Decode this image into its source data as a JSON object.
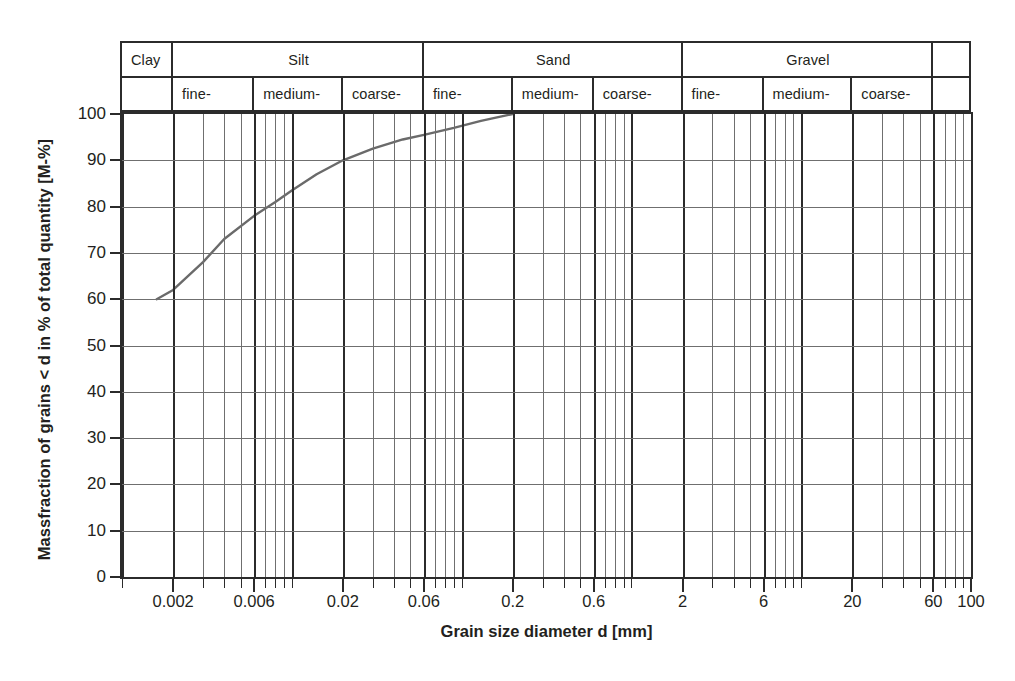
{
  "chart_data": {
    "type": "line",
    "title": "",
    "xlabel": "Grain size diameter d [mm]",
    "ylabel": "Massfraction of grains < d in % of total quantity [M-%]",
    "xscale": "log",
    "xlim": [
      0.001,
      100
    ],
    "ylim": [
      0,
      100
    ],
    "grid": true,
    "legend": "none",
    "x_ticks": [
      {
        "value": 0.002,
        "label": "0.002",
        "major": true
      },
      {
        "value": 0.006,
        "label": "0.006",
        "major": true
      },
      {
        "value": 0.02,
        "label": "0.02",
        "major": true
      },
      {
        "value": 0.06,
        "label": "0.06",
        "major": true
      },
      {
        "value": 0.2,
        "label": "0.2",
        "major": true
      },
      {
        "value": 0.6,
        "label": "0.6",
        "major": true
      },
      {
        "value": 2,
        "label": "2",
        "major": true
      },
      {
        "value": 6,
        "label": "6",
        "major": true
      },
      {
        "value": 20,
        "label": "20",
        "major": true
      },
      {
        "value": 60,
        "label": "60",
        "major": true
      },
      {
        "value": 100,
        "label": "100",
        "major": true
      }
    ],
    "y_ticks": [
      {
        "value": 0,
        "label": "0"
      },
      {
        "value": 10,
        "label": "10"
      },
      {
        "value": 20,
        "label": "20"
      },
      {
        "value": 30,
        "label": "30"
      },
      {
        "value": 40,
        "label": "40"
      },
      {
        "value": 50,
        "label": "50"
      },
      {
        "value": 60,
        "label": "60"
      },
      {
        "value": 70,
        "label": "70"
      },
      {
        "value": 80,
        "label": "80"
      },
      {
        "value": 90,
        "label": "90"
      },
      {
        "value": 100,
        "label": "100"
      }
    ],
    "series": [
      {
        "name": "grain size distribution",
        "color": "#6a6a6a",
        "points": [
          {
            "x": 0.0016,
            "y": 60
          },
          {
            "x": 0.002,
            "y": 62
          },
          {
            "x": 0.003,
            "y": 68
          },
          {
            "x": 0.004,
            "y": 73
          },
          {
            "x": 0.006,
            "y": 78
          },
          {
            "x": 0.008,
            "y": 81
          },
          {
            "x": 0.01,
            "y": 83.5
          },
          {
            "x": 0.014,
            "y": 87
          },
          {
            "x": 0.02,
            "y": 90
          },
          {
            "x": 0.03,
            "y": 92.5
          },
          {
            "x": 0.045,
            "y": 94.5
          },
          {
            "x": 0.06,
            "y": 95.5
          },
          {
            "x": 0.09,
            "y": 97
          },
          {
            "x": 0.13,
            "y": 98.5
          },
          {
            "x": 0.2,
            "y": 100
          }
        ]
      }
    ]
  },
  "classification": {
    "top_row": [
      {
        "label": "Clay",
        "from": 0.001,
        "to": 0.002,
        "align": "left"
      },
      {
        "label": "Silt",
        "from": 0.002,
        "to": 0.06,
        "align": "center"
      },
      {
        "label": "Sand",
        "from": 0.06,
        "to": 2,
        "align": "center"
      },
      {
        "label": "Gravel",
        "from": 2,
        "to": 60,
        "align": "center"
      },
      {
        "label": "",
        "from": 60,
        "to": 100,
        "align": "center"
      }
    ],
    "bottom_row": [
      {
        "label": "",
        "from": 0.001,
        "to": 0.002,
        "align": "left"
      },
      {
        "label": "fine-",
        "from": 0.002,
        "to": 0.006,
        "align": "left"
      },
      {
        "label": "medium-",
        "from": 0.006,
        "to": 0.02,
        "align": "left"
      },
      {
        "label": "coarse-",
        "from": 0.02,
        "to": 0.06,
        "align": "left"
      },
      {
        "label": "fine-",
        "from": 0.06,
        "to": 0.2,
        "align": "left"
      },
      {
        "label": "medium-",
        "from": 0.2,
        "to": 0.6,
        "align": "left"
      },
      {
        "label": "coarse-",
        "from": 0.6,
        "to": 2,
        "align": "left"
      },
      {
        "label": "fine-",
        "from": 2,
        "to": 6,
        "align": "left"
      },
      {
        "label": "medium-",
        "from": 6,
        "to": 20,
        "align": "left"
      },
      {
        "label": "coarse-",
        "from": 20,
        "to": 60,
        "align": "left"
      },
      {
        "label": "",
        "from": 60,
        "to": 100,
        "align": "left"
      }
    ]
  },
  "colors": {
    "frame": "#2b2b2b",
    "minor_grid": "#6f6f6f",
    "curve": "#6a6a6a",
    "text": "#231f20",
    "background": "#ffffff"
  }
}
